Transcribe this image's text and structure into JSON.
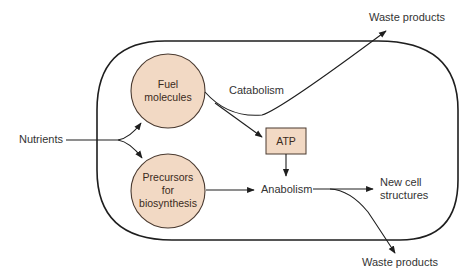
{
  "diagram": {
    "type": "metabolism-flow",
    "colors": {
      "node_fill": "#f2d9c4",
      "node_stroke": "#4a3a30",
      "line": "#1e1e1e"
    },
    "labels": {
      "nutrients": "Nutrients",
      "catabolism": "Catabolism",
      "anabolism": "Anabolism",
      "waste_top": "Waste products",
      "waste_bottom": "Waste products",
      "new_cell_1": "New cell",
      "new_cell_2": "structures"
    },
    "nodes": {
      "fuel": {
        "line1": "Fuel",
        "line2": "molecules"
      },
      "precursors": {
        "line1": "Precursors",
        "line2": "for",
        "line3": "biosynthesis"
      },
      "atp": {
        "label": "ATP"
      }
    },
    "edges": [
      {
        "from": "Nutrients",
        "to": "Fuel molecules"
      },
      {
        "from": "Nutrients",
        "to": "Precursors for biosynthesis"
      },
      {
        "from": "Fuel molecules",
        "to": "ATP",
        "via": "Catabolism"
      },
      {
        "from": "Fuel molecules",
        "to": "Waste products",
        "via": "Catabolism"
      },
      {
        "from": "ATP",
        "to": "Anabolism"
      },
      {
        "from": "Precursors for biosynthesis",
        "to": "Anabolism"
      },
      {
        "from": "Anabolism",
        "to": "New cell structures"
      },
      {
        "from": "Anabolism",
        "to": "Waste products"
      }
    ]
  }
}
